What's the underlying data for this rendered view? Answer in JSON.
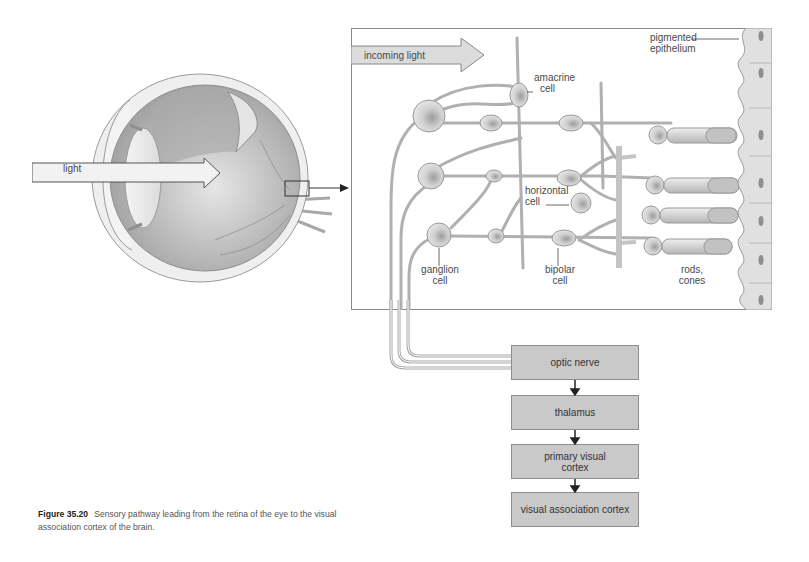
{
  "eye": {
    "light_label": "light"
  },
  "retina_panel": {
    "incoming_light_label": "incoming light",
    "labels": {
      "pigmented_epithelium": [
        "pigmented",
        "epithelium"
      ],
      "amacrine_cell": [
        "amacrine",
        "cell"
      ],
      "horizontal_cell": [
        "horizontal",
        "cell"
      ],
      "ganglion_cell": [
        "ganglion",
        "cell"
      ],
      "bipolar_cell": [
        "bipolar",
        "cell"
      ],
      "rods_cones": [
        "rods,",
        "cones"
      ]
    }
  },
  "pathway": {
    "steps": [
      {
        "label": "optic nerve"
      },
      {
        "label_lines": [
          "primary visual",
          "cortex"
        ],
        "label": "thalamus"
      },
      {
        "label_lines": [
          "primary visual",
          "cortex"
        ]
      },
      {
        "label_lines": [
          "visual association",
          "cortex"
        ]
      }
    ],
    "step_labels": [
      "optic nerve",
      "thalamus",
      "primary visual cortex",
      "visual association cortex"
    ]
  },
  "caption": {
    "figure_number": "Figure 35.20",
    "text": "Sensory pathway leading from the retina of the eye to the visual association cortex of the brain."
  },
  "colors": {
    "flow_box_fill": "#c9c9c9",
    "flow_box_border": "#8d8d8d",
    "panel_border": "#8a8a8a",
    "cell_fill": "#d8d8d8"
  }
}
